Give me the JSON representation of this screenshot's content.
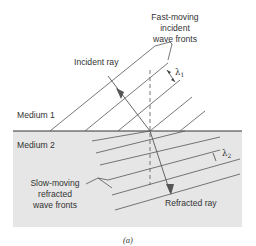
{
  "diagram": {
    "type": "wave refraction",
    "labels": {
      "fast_line1": "Fast-moving",
      "fast_line2": "incident",
      "fast_line3": "wave fronts",
      "incident_ray": "Incident ray",
      "medium1": "Medium 1",
      "medium2": "Medium 2",
      "slow_line1": "Slow-moving",
      "slow_line2": "refracted",
      "slow_line3": "wave fronts",
      "refracted_ray": "Refracted ray",
      "lambda1": "λ",
      "lambda1_sub": "1",
      "lambda2": "λ",
      "lambda2_sub": "2",
      "caption": "(a)"
    },
    "colors": {
      "medium2_fill": "#e6e6e6",
      "line": "#4d4d4d",
      "text": "#333333",
      "interface": "#333333"
    }
  }
}
